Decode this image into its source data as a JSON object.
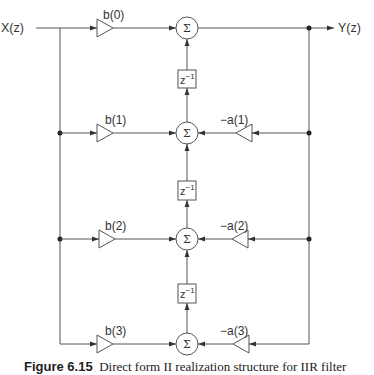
{
  "diagram": {
    "input_label": "X(z)",
    "output_label": "Y(z)",
    "sum_symbol": "Σ",
    "delay_label": "z",
    "delay_exponent": "−1",
    "feedforward_gains": [
      "b(0)",
      "b(1)",
      "b(2)",
      "b(3)"
    ],
    "feedback_gains": [
      "−a(1)",
      "−a(2)",
      "−a(3)"
    ],
    "stroke_color": "#555555"
  },
  "caption": {
    "number": "Figure 6.15",
    "text": "Direct form II realization structure for IIR filter"
  }
}
